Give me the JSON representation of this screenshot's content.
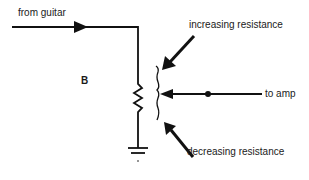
{
  "diagram": {
    "type": "potentiometer-circuit",
    "labels": {
      "input": "from guitar",
      "output": "to amp",
      "figure_letter": "B",
      "increase": "increasing resistance",
      "decrease": "decreasing resistance"
    },
    "components": [
      "input-wire",
      "resistor",
      "wiper",
      "ground",
      "junction-dot"
    ],
    "colors": {
      "line": "#111111",
      "background": "#ffffff"
    }
  }
}
